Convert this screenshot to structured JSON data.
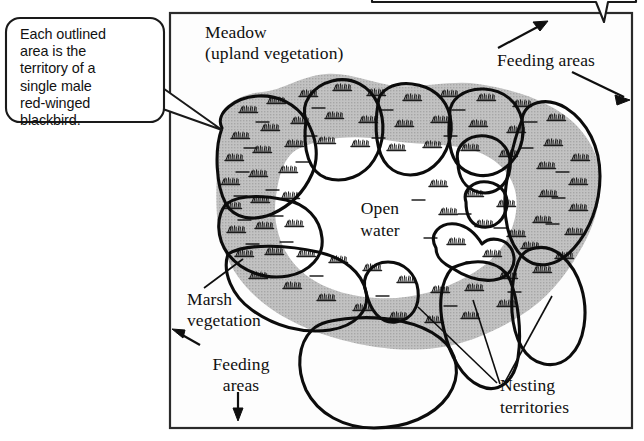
{
  "figure": {
    "colors": {
      "ink": "#101010",
      "marsh_fill": "#b9b9b9",
      "open_water_fill": "#ffffff",
      "page_background": "#ffffff",
      "frame_border": "#2b2b2b"
    }
  },
  "callouts": [
    {
      "id": "territory-callout",
      "text": "Each outlined\narea is the\nterritory of a\nsingle male\nred-winged\nblackbird.",
      "shape": "rounded-rectangle-with-pointer",
      "pointer_direction": "right"
    },
    {
      "id": "top-callout-clipped",
      "text": "",
      "shape": "rounded-rectangle-with-pointer",
      "pointer_direction": "down",
      "note": "cropped off top edge of screenshot"
    }
  ],
  "map_labels": {
    "meadow": "Meadow\n(upland vegetation)",
    "open_water": "Open\nwater",
    "marsh_vegetation": "Marsh\nvegetation",
    "feeding_areas_bottom_left": "Feeding\nareas",
    "feeding_areas_top_right": "Feeding areas",
    "nesting_territories": "Nesting\nterritories"
  },
  "annotations": {
    "arrow_feeding_up_right": "arrow pointing up-right to meadow",
    "arrow_feeding_down_right": "arrow pointing down-right to meadow",
    "arrow_feeding_left": "arrow pointing up-left to meadow",
    "arrow_feeding_down": "arrow pointing down to meadow",
    "leader_marsh": "line from Marsh vegetation label to shaded marsh zone",
    "leaders_nesting": "three lines from Nesting territories label to outlined territories"
  },
  "legend_semantics": {
    "shaded_texture": "marsh vegetation (cattails / reeds)",
    "white_interior": "open water",
    "heavy_outlines": "individual male territories",
    "outside_frame": "meadow / upland vegetation"
  }
}
